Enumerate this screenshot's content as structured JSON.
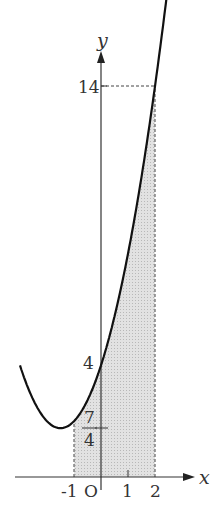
{
  "diagram": {
    "function": "y = x^2 + 3x + 4",
    "shaded_interval": [
      -1,
      2
    ],
    "axes": {
      "x_label": "x",
      "y_label": "y",
      "origin_label": "O"
    },
    "x_ticks": [
      "-1",
      "1",
      "2"
    ],
    "y_ticks": [
      "14",
      "4"
    ],
    "fraction_label": {
      "numerator": "7",
      "denominator": "4"
    },
    "colors": {
      "curve": "#111111",
      "shade": "#d9d9d9",
      "axis": "#333333"
    }
  }
}
